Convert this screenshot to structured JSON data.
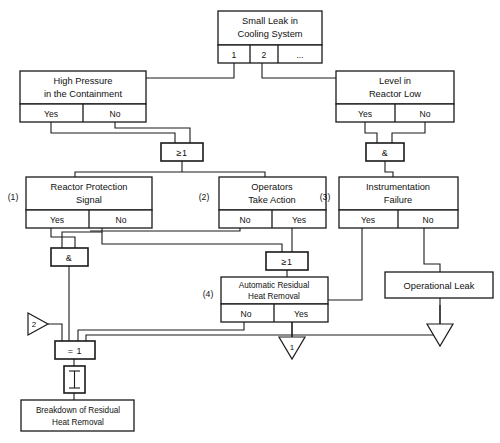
{
  "diagram": {
    "kind": "fault-tree",
    "title_node": {
      "label_line1": "Small Leak in",
      "label_line2": "Cooling System",
      "cells": [
        "1",
        "2",
        "..."
      ]
    },
    "events": [
      {
        "id": "high-pressure",
        "ref": "",
        "label_line1": "High Pressure",
        "label_line2": "in the Containment",
        "cells": [
          "Yes",
          "No"
        ]
      },
      {
        "id": "level-reactor-low",
        "ref": "",
        "label_line1": "Level in",
        "label_line2": "Reactor Low",
        "cells": [
          "Yes",
          "No"
        ]
      },
      {
        "id": "reactor-protection-signal",
        "ref": "(1)",
        "label_line1": "Reactor Protection",
        "label_line2": "Signal",
        "cells": [
          "Yes",
          "No"
        ]
      },
      {
        "id": "operators-take-action",
        "ref": "(2)",
        "label_line1": "Operators",
        "label_line2": "Take Action",
        "cells": [
          "No",
          "Yes"
        ]
      },
      {
        "id": "instrumentation-failure",
        "ref": "(3)",
        "label_line1": "Instrumentation",
        "label_line2": "Failure",
        "cells": [
          "Yes",
          "No"
        ]
      },
      {
        "id": "automatic-residual-heat-removal",
        "ref": "(4)",
        "label_line1": "Automatic Residual",
        "label_line2": "Heat Removal",
        "cells": [
          "No",
          "Yes"
        ]
      }
    ],
    "gates": [
      {
        "id": "or-top",
        "symbol": "≥1"
      },
      {
        "id": "and-right",
        "symbol": "&"
      },
      {
        "id": "and-left",
        "symbol": "&"
      },
      {
        "id": "or-mid",
        "symbol": "≥1"
      },
      {
        "id": "xor",
        "symbol": "= 1"
      }
    ],
    "terminals": [
      {
        "id": "operational-leak",
        "label": "Operational Leak"
      },
      {
        "id": "breakdown-residual-heat-removal",
        "label_line1": "Breakdown of Residual",
        "label_line2": "Heat Removal"
      }
    ],
    "transfers": [
      {
        "id": "transfer-in-2",
        "label": "2",
        "direction": "right"
      },
      {
        "id": "transfer-out-1",
        "label": "1",
        "direction": "down"
      },
      {
        "id": "transfer-out-2",
        "label": "",
        "direction": "down"
      }
    ],
    "inhibit": {
      "id": "inhibit-symbol",
      "symbol": "I"
    },
    "colors": {
      "line": "#1a1a1a",
      "fill": "#ffffff",
      "text": "#111111"
    }
  }
}
